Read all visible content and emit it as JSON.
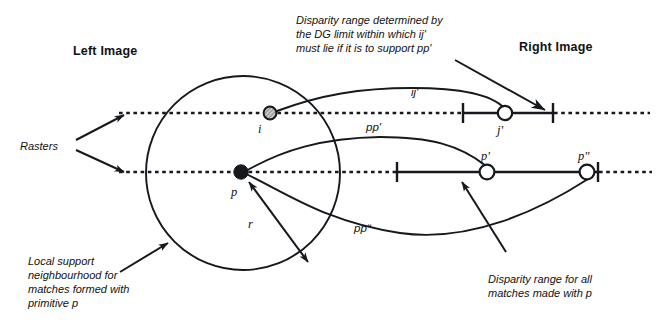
{
  "figure": {
    "title_left": "Left Image",
    "title_right": "Right Image"
  },
  "annotations": {
    "rasters": "Rasters",
    "disparity_ij": "Disparity range determined by\nthe DG limit within which ij'\nmust lie if it is to support pp'",
    "disparity_ij_l1": "Disparity range determined by",
    "disparity_ij_l2": "the DG limit within which ij'",
    "disparity_ij_l3": "must lie if it is to support pp'",
    "local_support_l1": "Local support",
    "local_support_l2": "neighbourhood for",
    "local_support_l3": "matches formed with",
    "local_support_l4": "primitive p",
    "disparity_all_l1": "Disparity range for all",
    "disparity_all_l2": "matches made with p"
  },
  "points": {
    "i": "i",
    "p": "p",
    "j_prime": "j'",
    "p_prime": "p'",
    "p_double_prime": "pʺ",
    "radius": "r"
  },
  "curves": {
    "ij_prime": "ij'",
    "pp_prime": "pp'",
    "pp_double_prime": "ppʺ"
  },
  "colors": {
    "ink": "#15181c",
    "paper": "#ffffff",
    "node_fill_hatch": "#9a9a9a"
  },
  "geometry": {
    "raster_upper_y": 113,
    "raster_lower_y": 172,
    "circle_center_x": 243,
    "circle_center_y": 173,
    "circle_radius": 97,
    "upper_range_left_tick_x": 463,
    "upper_range_right_tick_x": 553,
    "lower_range_left_tick_x": 397,
    "lower_range_right_tick_x": 598
  }
}
